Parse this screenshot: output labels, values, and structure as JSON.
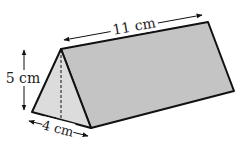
{
  "diagram": {
    "type": "triangular-prism",
    "labels": {
      "length": "11 cm",
      "height": "5 cm",
      "base": "4 cm"
    },
    "colors": {
      "front_face": "#d9d9d9",
      "side_face": "#c4c4c4",
      "stroke": "#111111"
    }
  }
}
